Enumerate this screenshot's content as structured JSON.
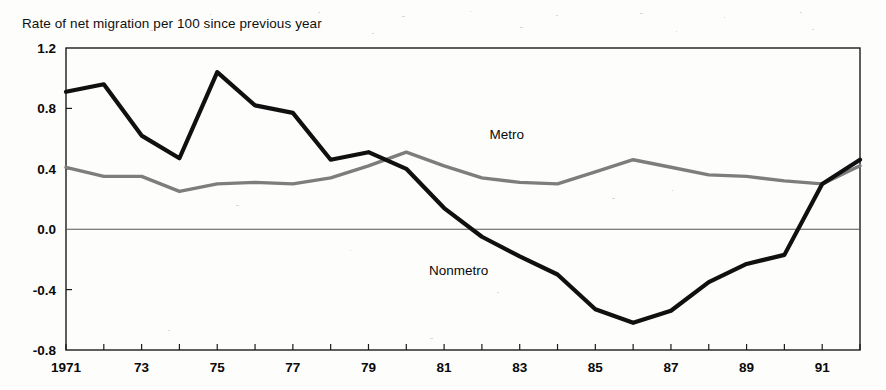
{
  "chart_data": {
    "type": "line",
    "title": "Rate of net migration per 100 since previous year",
    "xlabel": "",
    "ylabel": "",
    "xlim": [
      1971,
      1992
    ],
    "ylim": [
      -0.8,
      1.2
    ],
    "grid": false,
    "legend_position": "inline-annotation",
    "y_ticks": [
      1.2,
      0.8,
      0.4,
      0.0,
      -0.4,
      -0.8
    ],
    "y_tick_labels": [
      "1.2",
      "0.8",
      "0.4",
      "0.0",
      "-0.4",
      "-0.8"
    ],
    "x_ticks": [
      1971,
      1973,
      1975,
      1977,
      1979,
      1981,
      1983,
      1985,
      1987,
      1989,
      1991
    ],
    "x_tick_labels": [
      "1971",
      "73",
      "75",
      "77",
      "79",
      "81",
      "83",
      "85",
      "87",
      "89",
      "91"
    ],
    "x": [
      1971,
      1972,
      1973,
      1974,
      1975,
      1976,
      1977,
      1978,
      1979,
      1980,
      1981,
      1982,
      1983,
      1984,
      1985,
      1986,
      1987,
      1988,
      1989,
      1990,
      1991,
      1992
    ],
    "zero_line": 0.0,
    "series": [
      {
        "name": "Metro",
        "color": "#7d7d7d",
        "label_text": "Metro",
        "label_x": 1982.2,
        "label_y": 0.6,
        "values": [
          0.41,
          0.35,
          0.35,
          0.25,
          0.3,
          0.31,
          0.3,
          0.34,
          0.42,
          0.51,
          0.42,
          0.34,
          0.31,
          0.3,
          0.38,
          0.46,
          0.41,
          0.36,
          0.35,
          0.32,
          0.3,
          0.42
        ]
      },
      {
        "name": "Nonmetro",
        "color": "#101010",
        "label_text": "Nonmetro",
        "label_x": 1980.6,
        "label_y": -0.3,
        "values": [
          0.91,
          0.96,
          0.62,
          0.47,
          1.04,
          0.82,
          0.77,
          0.46,
          0.51,
          0.4,
          0.14,
          -0.05,
          -0.18,
          -0.3,
          -0.53,
          -0.62,
          -0.54,
          -0.35,
          -0.23,
          -0.17,
          0.3,
          0.46
        ]
      }
    ]
  },
  "axes": {
    "left_px": 66,
    "right_px": 860,
    "top_px": 48,
    "bottom_px": 350
  }
}
